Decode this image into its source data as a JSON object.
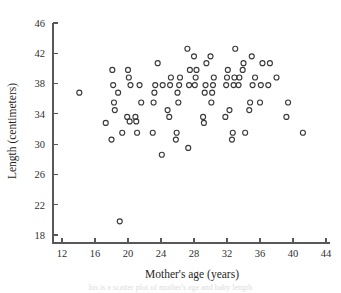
{
  "figure": {
    "caption_partial": "his is a scatter plot of mother's age and baby length",
    "marker_style": "open-circle"
  },
  "chart_data": {
    "type": "scatter",
    "title": "",
    "xlabel": "Mother's age (years)",
    "ylabel": "Length (centimeters)",
    "xlim": [
      12,
      44
    ],
    "ylim": [
      18,
      46
    ],
    "xticks": [
      12,
      16,
      20,
      24,
      28,
      32,
      36,
      40,
      44
    ],
    "yticks": [
      18,
      22,
      26,
      30,
      34,
      38,
      42,
      46
    ],
    "grid": false,
    "legend": null,
    "series": [
      {
        "name": "Babies",
        "marker": "open-circle",
        "color": "#3a3a3a",
        "points": [
          [
            14.1,
            36.8
          ],
          [
            17.3,
            32.8
          ],
          [
            18.0,
            30.6
          ],
          [
            18.1,
            39.8
          ],
          [
            18.2,
            37.8
          ],
          [
            18.3,
            35.5
          ],
          [
            18.4,
            34.5
          ],
          [
            18.8,
            36.8
          ],
          [
            19.0,
            19.8
          ],
          [
            19.3,
            31.5
          ],
          [
            19.9,
            33.6
          ],
          [
            20.0,
            39.8
          ],
          [
            20.1,
            38.8
          ],
          [
            20.2,
            33.0
          ],
          [
            20.3,
            37.8
          ],
          [
            20.9,
            33.6
          ],
          [
            21.0,
            33.0
          ],
          [
            21.1,
            31.5
          ],
          [
            21.4,
            37.8
          ],
          [
            21.6,
            35.5
          ],
          [
            23.0,
            31.5
          ],
          [
            23.1,
            35.5
          ],
          [
            23.2,
            36.8
          ],
          [
            23.3,
            37.8
          ],
          [
            23.6,
            40.7
          ],
          [
            24.1,
            28.6
          ],
          [
            24.2,
            37.8
          ],
          [
            24.8,
            34.5
          ],
          [
            25.0,
            33.6
          ],
          [
            25.1,
            37.8
          ],
          [
            25.2,
            38.8
          ],
          [
            25.8,
            30.6
          ],
          [
            25.9,
            31.5
          ],
          [
            26.0,
            36.8
          ],
          [
            26.1,
            35.5
          ],
          [
            26.2,
            37.8
          ],
          [
            26.3,
            38.8
          ],
          [
            27.2,
            42.6
          ],
          [
            27.3,
            29.5
          ],
          [
            27.4,
            37.8
          ],
          [
            27.5,
            39.8
          ],
          [
            28.0,
            41.6
          ],
          [
            28.1,
            37.8
          ],
          [
            28.2,
            38.8
          ],
          [
            28.3,
            39.8
          ],
          [
            29.1,
            33.6
          ],
          [
            29.2,
            32.8
          ],
          [
            29.3,
            36.8
          ],
          [
            29.4,
            37.8
          ],
          [
            29.5,
            40.7
          ],
          [
            30.0,
            41.6
          ],
          [
            30.1,
            35.5
          ],
          [
            30.2,
            36.8
          ],
          [
            30.3,
            37.8
          ],
          [
            30.4,
            38.8
          ],
          [
            31.8,
            33.6
          ],
          [
            31.9,
            37.8
          ],
          [
            32.0,
            38.8
          ],
          [
            32.1,
            39.8
          ],
          [
            32.3,
            34.5
          ],
          [
            32.6,
            30.6
          ],
          [
            32.7,
            31.5
          ],
          [
            32.8,
            37.8
          ],
          [
            32.9,
            38.8
          ],
          [
            33.0,
            42.6
          ],
          [
            33.4,
            37.8
          ],
          [
            33.5,
            38.8
          ],
          [
            33.9,
            39.8
          ],
          [
            34.0,
            40.7
          ],
          [
            34.2,
            31.5
          ],
          [
            34.7,
            34.5
          ],
          [
            34.8,
            35.5
          ],
          [
            35.0,
            41.6
          ],
          [
            35.1,
            37.8
          ],
          [
            35.4,
            38.8
          ],
          [
            36.0,
            35.5
          ],
          [
            36.1,
            37.8
          ],
          [
            36.3,
            40.7
          ],
          [
            37.0,
            37.8
          ],
          [
            37.2,
            40.7
          ],
          [
            38.0,
            38.8
          ],
          [
            39.2,
            33.6
          ],
          [
            39.4,
            35.5
          ],
          [
            41.2,
            31.5
          ]
        ]
      }
    ]
  }
}
